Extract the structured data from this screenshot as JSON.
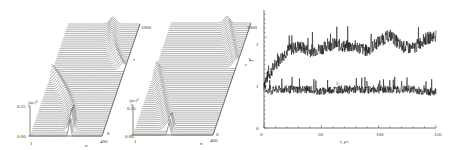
{
  "figure": {
    "panel_a": {
      "ylabel": "|ψₙ|²",
      "y_ticks": [
        "0.25",
        "0.00"
      ],
      "x_label": "n",
      "x_ticks": [
        "1",
        "400"
      ],
      "depth_label": "τ",
      "depth_ticks": [
        "0",
        "1000"
      ]
    },
    "panel_b": {
      "ylabel": "|ψₙ|²",
      "y_ticks": [
        "0.25",
        "0.00"
      ],
      "x_label": "n",
      "x_ticks": [
        "1",
        "400"
      ],
      "depth_label": "τ",
      "depth_ticks": [
        "0",
        "1000"
      ]
    },
    "panel_c": {
      "ylabel": "F",
      "xlabel": "t, ps",
      "x_ticks": [
        "0",
        "50",
        "100",
        "150"
      ],
      "y_ticks": [
        "0",
        "1",
        "2"
      ],
      "curve_labels": [
        "1",
        "2"
      ]
    }
  },
  "chart_data": [
    {
      "type": "area",
      "title": "",
      "description": "3D waterfall of |ψ_n|^2 over site n and time τ; localized peak drifting/spreading",
      "xlabel": "n",
      "ylabel": "|ψn|²",
      "zlabel": "τ",
      "xlim": [
        1,
        400
      ],
      "ylim": [
        0.0,
        0.25
      ],
      "zlim": [
        0,
        1000
      ]
    },
    {
      "type": "area",
      "title": "",
      "description": "3D waterfall of |ψ_n|^2 over site n and time τ; peak moving across chain",
      "xlabel": "n",
      "ylabel": "|ψn|²",
      "zlabel": "τ",
      "xlim": [
        1,
        400
      ],
      "ylim": [
        0.0,
        0.25
      ],
      "zlim": [
        0,
        1000
      ]
    },
    {
      "type": "line",
      "title": "",
      "xlabel": "t, ps",
      "ylabel": "F",
      "xlim": [
        0,
        150
      ],
      "ylim": [
        0,
        2.6
      ],
      "x": [
        0,
        5,
        10,
        15,
        20,
        25,
        30,
        40,
        50,
        60,
        70,
        80,
        90,
        100,
        110,
        120,
        130,
        140,
        150
      ],
      "series": [
        {
          "name": "1",
          "values": [
            1.0,
            1.2,
            1.4,
            1.55,
            1.7,
            1.75,
            1.8,
            1.7,
            1.75,
            1.85,
            1.8,
            1.8,
            1.7,
            1.9,
            2.05,
            1.8,
            1.75,
            1.95,
            2.05
          ]
        },
        {
          "name": "2",
          "values": [
            0.9,
            0.8,
            0.85,
            0.85,
            0.85,
            0.85,
            0.85,
            0.85,
            0.8,
            0.85,
            0.85,
            0.85,
            0.85,
            0.85,
            0.85,
            0.85,
            0.85,
            0.8,
            0.8
          ]
        }
      ],
      "grid": false,
      "legend": "inline labels near curves"
    }
  ]
}
